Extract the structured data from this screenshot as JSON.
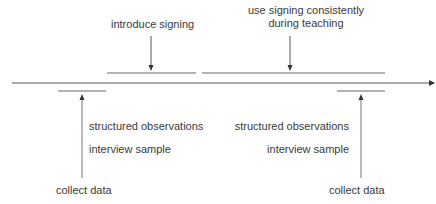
{
  "diagram": {
    "top_labels": {
      "introduce_signing": "introduce signing",
      "use_signing_line1": "use signing consistently",
      "use_signing_line2": "during teaching"
    },
    "left_phase": {
      "observations": "structured observations",
      "interview": "interview sample",
      "collect": "collect data"
    },
    "right_phase": {
      "observations": "structured observations",
      "interview": "interview sample",
      "collect": "collect data"
    },
    "colors": {
      "line": "#555555",
      "text": "#3a3a3a",
      "background": "#ffffff"
    }
  }
}
